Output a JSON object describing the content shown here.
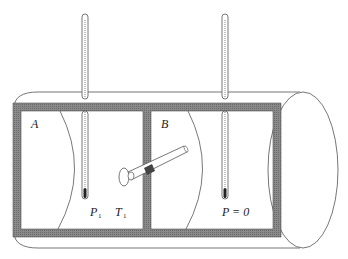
{
  "diagram": {
    "chambers": [
      {
        "id": "A",
        "label": "A",
        "conditions": {
          "pressure_label": "P",
          "pressure_sub": "1",
          "temperature_label": "T",
          "temperature_sub": "1"
        }
      },
      {
        "id": "B",
        "label": "B",
        "conditions": {
          "text_main": "P = 0"
        }
      }
    ],
    "components": {
      "thermometers": [
        "thermometer-A",
        "thermometer-B"
      ],
      "valve": "stopcock-between-chambers",
      "enclosure": "cylindrical-insulated-vessel"
    },
    "colors": {
      "wall": "#7a7a7a",
      "line": "#555555",
      "background": "#ffffff",
      "mercury": "#222222"
    }
  }
}
